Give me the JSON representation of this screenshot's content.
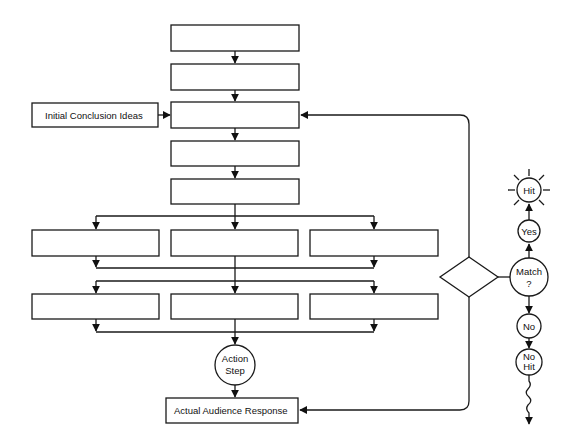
{
  "diagram": {
    "type": "flowchart",
    "main_column_boxes": [
      {
        "id": "step1",
        "label": ""
      },
      {
        "id": "step2",
        "label": ""
      },
      {
        "id": "step3",
        "label": ""
      },
      {
        "id": "step4",
        "label": ""
      },
      {
        "id": "step5",
        "label": ""
      }
    ],
    "side_input": {
      "label": "Initial Conclusion Ideas"
    },
    "parallel_row_1": [
      {
        "label": ""
      },
      {
        "label": ""
      },
      {
        "label": ""
      }
    ],
    "parallel_row_2": [
      {
        "label": ""
      },
      {
        "label": ""
      },
      {
        "label": ""
      }
    ],
    "action_step": {
      "line1": "Action",
      "line2": "Step"
    },
    "response_box": {
      "label": "Actual Audience Response"
    },
    "decision": {
      "label": ""
    },
    "match_node": {
      "line1": "Match",
      "line2": "?"
    },
    "yes_node": {
      "label": "Yes"
    },
    "hit_node": {
      "label": "Hit"
    },
    "no_node": {
      "label": "No"
    },
    "no_hit_node": {
      "line1": "No",
      "line2": "Hit"
    }
  }
}
